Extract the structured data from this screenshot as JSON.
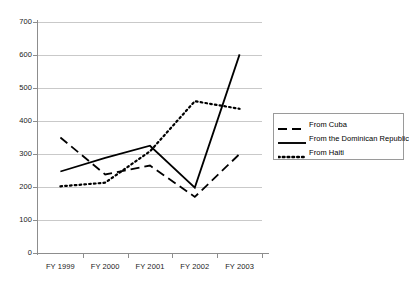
{
  "chart_data": {
    "type": "line",
    "title": "",
    "xlabel": "",
    "ylabel": "",
    "categories": [
      "FY 1999",
      "FY 2000",
      "FY 2001",
      "FY 2002",
      "FY 2003"
    ],
    "ylim": [
      0,
      700
    ],
    "ytick_values": [
      0,
      100,
      200,
      300,
      400,
      500,
      600,
      700
    ],
    "ytick_labels": [
      "0",
      "100",
      "200",
      "300",
      "400",
      "500",
      "600",
      "700"
    ],
    "grid": true,
    "legend_position": "right",
    "series": [
      {
        "name": "From Cuba",
        "style": "dashed",
        "color": "#000000",
        "values": [
          350,
          238,
          265,
          170,
          300
        ]
      },
      {
        "name": "From the Dominican Republic",
        "style": "solid",
        "color": "#000000",
        "values": [
          247,
          288,
          325,
          198,
          602
        ]
      },
      {
        "name": "From Haiti",
        "style": "dotted",
        "color": "#000000",
        "values": [
          202,
          213,
          308,
          460,
          437
        ]
      }
    ]
  },
  "legend": {
    "items": [
      {
        "label": "From Cuba",
        "style": "dashed"
      },
      {
        "label": "From the Dominican Republic",
        "style": "solid"
      },
      {
        "label": "From Haiti",
        "style": "dotted"
      }
    ]
  },
  "axes": {
    "y_labels": [
      "700",
      "600",
      "500",
      "400",
      "300",
      "200",
      "100",
      "0"
    ],
    "x_labels": [
      "FY 1999",
      "FY 2000",
      "FY 2001",
      "FY 2002",
      "FY 2003"
    ]
  }
}
